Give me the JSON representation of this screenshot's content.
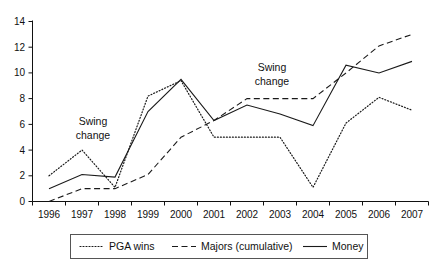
{
  "chart_data": {
    "type": "line",
    "title": "",
    "subtitle": "",
    "xlabel": "",
    "ylabel": "",
    "categories": [
      "1996",
      "1997",
      "1998",
      "1999",
      "2000",
      "2001",
      "2002",
      "2003",
      "2004",
      "2005",
      "2006",
      "2007"
    ],
    "yticks": [
      "0",
      "2",
      "4",
      "6",
      "8",
      "10",
      "12",
      "14"
    ],
    "ylim": [
      0,
      14
    ],
    "grid": false,
    "legend_position": "bottom",
    "series": [
      {
        "name": "PGA wins",
        "style": "dotted",
        "values": [
          2.0,
          4.0,
          1.1,
          8.2,
          9.4,
          5.0,
          5.0,
          5.0,
          1.1,
          6.1,
          8.1,
          7.1
        ]
      },
      {
        "name": "Majors (cumulative)",
        "style": "dashed",
        "values": [
          0.0,
          1.0,
          1.0,
          2.1,
          5.0,
          6.3,
          8.0,
          8.0,
          8.0,
          10.0,
          12.1,
          13.0
        ]
      },
      {
        "name": "Money",
        "style": "solid",
        "values": [
          1.0,
          2.1,
          1.9,
          7.0,
          9.5,
          6.3,
          7.5,
          6.8,
          5.9,
          10.6,
          10.0,
          10.9
        ]
      }
    ],
    "annotations": [
      {
        "text_line1": "Swing",
        "text_line2": "change",
        "near_category": "1997"
      },
      {
        "text_line1": "Swing",
        "text_line2": "change",
        "near_category": "2002"
      }
    ]
  },
  "legend": {
    "items": [
      {
        "label": "PGA wins",
        "style": "dotted"
      },
      {
        "label": "Majors (cumulative)",
        "style": "dashed"
      },
      {
        "label": "Money",
        "style": "solid"
      }
    ]
  },
  "colors": {
    "line": "#1a1a1a",
    "axis": "#111111",
    "text": "#111111",
    "legend_border": "#555555",
    "background": "#ffffff"
  }
}
